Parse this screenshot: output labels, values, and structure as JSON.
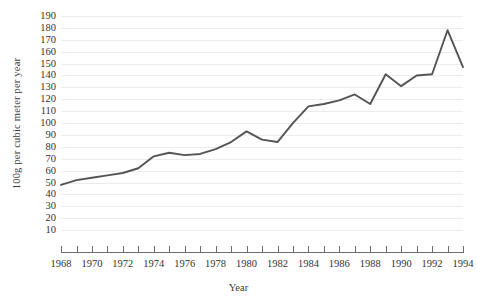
{
  "chart_data": {
    "type": "line",
    "title": "",
    "xlabel": "Year",
    "ylabel": "100g per cubic meter per year",
    "xlim": [
      1968,
      1994
    ],
    "ylim": [
      0,
      195
    ],
    "grid": true,
    "legend": false,
    "line_color": "#545454",
    "grid_color": "#ececec",
    "axis_color": "#6d6d6d",
    "y_ticks": [
      190,
      180,
      170,
      160,
      150,
      140,
      130,
      120,
      110,
      100,
      90,
      80,
      70,
      60,
      50,
      40,
      30,
      20,
      10
    ],
    "x_ticks": [
      1968,
      1969,
      1970,
      1971,
      1972,
      1973,
      1974,
      1975,
      1976,
      1977,
      1978,
      1979,
      1980,
      1981,
      1982,
      1983,
      1984,
      1985,
      1986,
      1987,
      1988,
      1989,
      1990,
      1991,
      1992,
      1993,
      1994
    ],
    "x_tick_labels": [
      1968,
      1970,
      1972,
      1974,
      1976,
      1978,
      1980,
      1982,
      1984,
      1986,
      1988,
      1990,
      1992,
      1994
    ],
    "x": [
      1968,
      1969,
      1970,
      1971,
      1972,
      1973,
      1974,
      1975,
      1976,
      1977,
      1978,
      1979,
      1980,
      1981,
      1982,
      1983,
      1984,
      1985,
      1986,
      1987,
      1988,
      1989,
      1990,
      1991,
      1992,
      1993,
      1994
    ],
    "values": [
      48,
      52,
      54,
      56,
      58,
      62,
      72,
      75,
      73,
      74,
      78,
      84,
      93,
      86,
      84,
      100,
      114,
      116,
      119,
      124,
      116,
      141,
      131,
      140,
      141,
      178,
      147
    ],
    "series": [
      {
        "name": "100g per cubic meter per year",
        "values": [
          48,
          52,
          54,
          56,
          58,
          62,
          72,
          75,
          73,
          74,
          78,
          84,
          93,
          86,
          84,
          100,
          114,
          116,
          119,
          124,
          116,
          141,
          131,
          140,
          141,
          178,
          147
        ]
      }
    ]
  }
}
